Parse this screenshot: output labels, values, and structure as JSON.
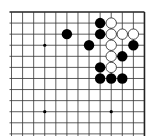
{
  "board": {
    "description": "Go board section (top-right corner visible, left and bottom edges cut off)",
    "columns": 13,
    "rows_visible": 12,
    "origin_x": 11.5,
    "origin_y": 12,
    "spacing": 11.08,
    "line_color": "#333333",
    "edge_color": "#222222",
    "background": "#ffffff",
    "edges": {
      "top": true,
      "right": true,
      "left": false,
      "bottom": false
    },
    "star_points": [
      {
        "col": 3,
        "row": 3
      },
      {
        "col": 3,
        "row": 9
      },
      {
        "col": 9,
        "row": 9
      }
    ],
    "stones": [
      {
        "color": "black",
        "col": 8,
        "row": 1
      },
      {
        "color": "white",
        "col": 9,
        "row": 1
      },
      {
        "color": "black",
        "col": 5,
        "row": 2
      },
      {
        "color": "black",
        "col": 8,
        "row": 2
      },
      {
        "color": "white",
        "col": 9,
        "row": 2
      },
      {
        "color": "white",
        "col": 10,
        "row": 2
      },
      {
        "color": "white",
        "col": 11,
        "row": 2
      },
      {
        "color": "black",
        "col": 7,
        "row": 3
      },
      {
        "color": "white",
        "col": 9,
        "row": 3
      },
      {
        "color": "black",
        "col": 11,
        "row": 3
      },
      {
        "color": "white",
        "col": 9,
        "row": 4
      },
      {
        "color": "black",
        "col": 10,
        "row": 4
      },
      {
        "color": "black",
        "col": 8,
        "row": 5
      },
      {
        "color": "white",
        "col": 9,
        "row": 5
      },
      {
        "color": "black",
        "col": 8,
        "row": 6
      },
      {
        "color": "black",
        "col": 9,
        "row": 6
      },
      {
        "color": "black",
        "col": 10,
        "row": 6
      }
    ],
    "colors": {
      "black_stone": "#000000",
      "white_stone_fill": "#ffffff",
      "white_stone_stroke": "#222222"
    }
  }
}
